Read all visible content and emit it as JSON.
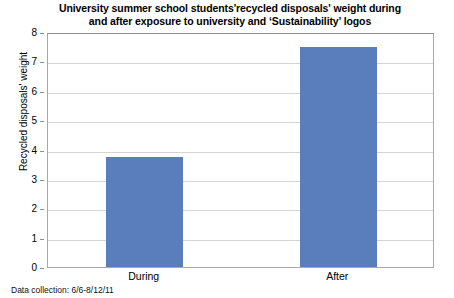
{
  "chart_data": {
    "type": "bar",
    "title": "University summer school students'recycled disposals' weight during and after exposure to university and ‘Sustainability’ logos",
    "title_lines": [
      "University summer school students'recycled disposals' weight during",
      "and after exposure to university and ‘Sustainability’ logos"
    ],
    "categories": [
      "During",
      "After"
    ],
    "values": [
      3.75,
      7.5
    ],
    "xlabel": "",
    "ylabel": "Recycled disposals' weight",
    "ylim": [
      0,
      8
    ],
    "ytick_labels": [
      "0",
      "1",
      "2",
      "3",
      "4",
      "5",
      "6",
      "7",
      "8"
    ],
    "ytick_values": [
      0,
      1,
      2,
      3,
      4,
      5,
      6,
      7,
      8
    ],
    "grid": true,
    "legend": false,
    "bar_color": "#5a7ebc",
    "grid_color": "#d4d4d4",
    "frame_color": "#a8a8a8",
    "background": "#ffffff"
  },
  "footnote": {
    "text": "Data collection: 6/6-8/12/11"
  }
}
